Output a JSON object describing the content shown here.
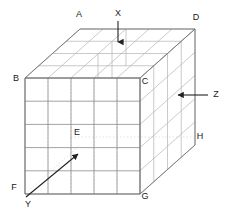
{
  "diagram": {
    "type": "isometric-grid-cube",
    "canvas": {
      "width": 228,
      "height": 212,
      "background": "#ffffff"
    },
    "colors": {
      "front_grid_line": "#8c8c8c",
      "top_grid_line": "#b0b0b0",
      "side_grid_line": "#b0b0b0",
      "outline": "#707070",
      "hidden_dotted": "#c9c9c9",
      "arrow": "#222222",
      "label_text": "#1a1a1a"
    },
    "geometry": {
      "front_face": {
        "note": "front face square, 5 by 5 cells",
        "left_x": 25,
        "right_x": 140,
        "top_y": 78,
        "bottom_y": 194,
        "cols": 5,
        "rows": 5
      },
      "depth_offset": {
        "dx": 55,
        "dy": -49,
        "steps": 4
      },
      "top_face": {
        "cols": 5,
        "rows": 4
      },
      "right_face": {
        "cols": 4,
        "rows": 5
      }
    },
    "vertex_labels": [
      {
        "id": "A",
        "text": "A",
        "x": 79,
        "y": 15
      },
      {
        "id": "D",
        "text": "D",
        "x": 196,
        "y": 18
      },
      {
        "id": "B",
        "text": "B",
        "x": 16,
        "y": 79
      },
      {
        "id": "C",
        "text": "C",
        "x": 145,
        "y": 82
      },
      {
        "id": "E",
        "text": "E",
        "x": 77,
        "y": 133
      },
      {
        "id": "H",
        "text": "H",
        "x": 200,
        "y": 137
      },
      {
        "id": "F",
        "text": "F",
        "x": 14,
        "y": 188
      },
      {
        "id": "G",
        "text": "G",
        "x": 145,
        "y": 197
      }
    ],
    "axis_labels": [
      {
        "id": "X",
        "text": "X",
        "x": 118,
        "y": 14
      },
      {
        "id": "Z",
        "text": "Z",
        "x": 216,
        "y": 95
      },
      {
        "id": "Y",
        "text": "Y",
        "x": 28,
        "y": 205
      }
    ],
    "arrows": [
      {
        "id": "x-arrow",
        "label": "X",
        "direction": "down",
        "x1": 118,
        "y1": 21,
        "x2": 118,
        "y2": 45
      },
      {
        "id": "z-arrow",
        "label": "Z",
        "direction": "left",
        "x1": 208,
        "y1": 95,
        "x2": 175,
        "y2": 95
      },
      {
        "id": "y-arrow",
        "label": "Y",
        "direction": "up-right",
        "x1": 26,
        "y1": 197,
        "x2": 81,
        "y2": 151
      }
    ],
    "hidden_lines": [
      {
        "id": "e-to-h-dotted",
        "x1": 71,
        "y1": 137,
        "x2": 196,
        "y2": 137
      },
      {
        "id": "f-to-back-dotted",
        "x1": 25,
        "y1": 194,
        "x2": 80,
        "y2": 145
      }
    ]
  }
}
